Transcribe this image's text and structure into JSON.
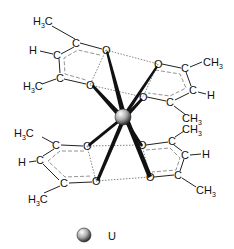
{
  "atoms": {
    "ring_ul": {
      "me_top": "H3C",
      "h": "H",
      "me_bot": "H3C"
    },
    "ring_ur": {
      "me_top": "CH3",
      "h": "H",
      "me_bot": "CH3"
    },
    "ring_ll": {
      "me_top": "H3C",
      "h": "H",
      "me_bot": "H3C"
    },
    "ring_lr": {
      "me_top": "CH3",
      "h": "H",
      "me_bot": "CH3"
    },
    "carbon": "C",
    "oxygen": "O"
  },
  "legend": {
    "label": "U"
  },
  "colors": {
    "bond": "#111111",
    "dashed": "#777777",
    "sphere_light": "#f4f4f4",
    "sphere_dark": "#3a3a3a"
  }
}
